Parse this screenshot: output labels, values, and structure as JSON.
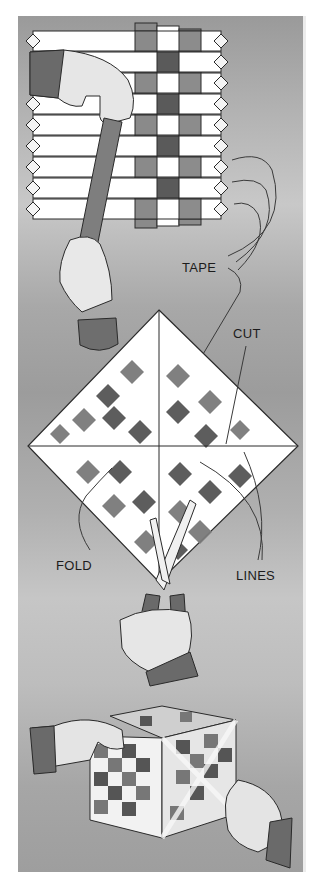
{
  "illustration": {
    "title": "Woven paper strip box instructions",
    "step1": {
      "label_tape": "TAPE",
      "description": "Weaving paper strips, hand threading a strip through horizontal strips"
    },
    "step2": {
      "label_cut": "CUT",
      "label_fold": "FOLD",
      "label_lines": "LINES",
      "description": "Diamond-shaped woven square with cut and fold lines, scissors cutting"
    },
    "step3": {
      "description": "Hands holding assembled woven cube"
    },
    "colors": {
      "background_dark": "#9a9a9a",
      "background_light": "#c8c8c8",
      "strip_white": "#ffffff",
      "strip_mid": "#8a8a8a",
      "strip_dark": "#5a5a5a",
      "outline": "#2a2a2a"
    }
  }
}
